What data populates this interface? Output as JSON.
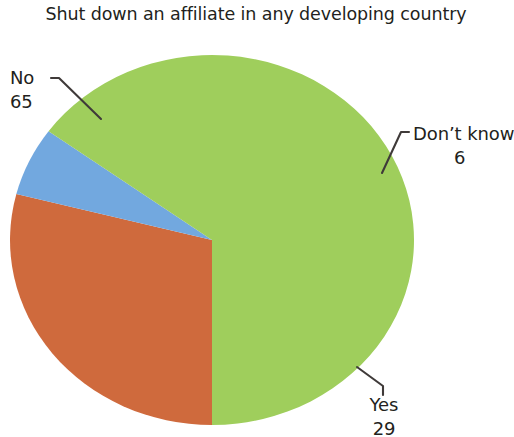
{
  "chart_data": {
    "type": "pie",
    "title": "Shut down an affiliate in any developing country",
    "categories": [
      "No",
      "Yes",
      "Don’t know"
    ],
    "values": [
      65,
      29,
      6
    ],
    "value_unit": "percent",
    "labels": [
      {
        "name": "No",
        "value": 65,
        "color": "#9fce5c"
      },
      {
        "name": "Yes",
        "value": 29,
        "color": "#cf6a3d"
      },
      {
        "name": "Don’t know",
        "value": 6,
        "color": "#72a8df"
      }
    ],
    "colors": [
      "#9fce5c",
      "#cf6a3d",
      "#72a8df"
    ],
    "legend": "none",
    "legend_position": "callout-labels",
    "start_angle_deg": 180,
    "direction": "clockwise",
    "grid": false,
    "xlabel": "",
    "ylabel": ""
  },
  "geometry": {
    "center_x": 212,
    "center_y": 240,
    "radius_x": 202,
    "radius_y": 185,
    "slices": [
      {
        "name": "Yes",
        "start_deg": 180,
        "sweep_deg": 104.4
      },
      {
        "name": "Don’t know",
        "start_deg": 284.4,
        "sweep_deg": 21.6
      },
      {
        "name": "No",
        "start_deg": 306,
        "sweep_deg": 234
      }
    ]
  },
  "title": {
    "text": "Shut down an affiliate in any developing country"
  },
  "callouts": {
    "no": {
      "category": "No",
      "value": "65"
    },
    "dont_know": {
      "category": "Don’t know",
      "value": "6"
    },
    "yes": {
      "category": "Yes",
      "value": "29"
    }
  },
  "style": {
    "text_color": "#231f20",
    "background": "#ffffff",
    "leader_color": "#3f3a39"
  }
}
